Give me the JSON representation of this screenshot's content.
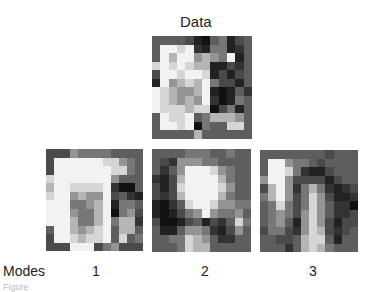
{
  "figure": {
    "title": "Data",
    "modes_label": "Modes",
    "mode_numbers": [
      "1",
      "2",
      "3"
    ],
    "caption": "Figure"
  },
  "palette_levels": [
    "#111111",
    "#222222",
    "#333333",
    "#4a4a4a",
    "#5e5e5e",
    "#777777",
    "#949494",
    "#b5b5b5",
    "#d6d6d6",
    "#f2f2f2"
  ],
  "panels": {
    "data": [
      [
        4,
        4,
        4,
        4,
        3,
        1,
        0,
        4,
        5,
        1,
        3,
        4
      ],
      [
        4,
        9,
        9,
        8,
        9,
        2,
        1,
        5,
        5,
        1,
        2,
        4
      ],
      [
        4,
        9,
        7,
        9,
        9,
        6,
        7,
        6,
        5,
        9,
        1,
        4
      ],
      [
        8,
        9,
        8,
        9,
        8,
        7,
        7,
        1,
        1,
        3,
        2,
        4
      ],
      [
        3,
        9,
        9,
        8,
        9,
        9,
        8,
        1,
        3,
        1,
        3,
        4
      ],
      [
        1,
        9,
        6,
        7,
        8,
        7,
        9,
        5,
        3,
        3,
        1,
        4
      ],
      [
        9,
        8,
        7,
        6,
        6,
        7,
        9,
        1,
        0,
        1,
        4,
        2
      ],
      [
        9,
        8,
        7,
        6,
        7,
        6,
        9,
        2,
        0,
        1,
        5,
        4
      ],
      [
        9,
        8,
        8,
        8,
        7,
        8,
        8,
        0,
        3,
        5,
        1,
        4
      ],
      [
        4,
        9,
        8,
        8,
        9,
        4,
        5,
        7,
        7,
        7,
        6,
        4
      ],
      [
        4,
        9,
        9,
        8,
        9,
        0,
        5,
        4,
        4,
        8,
        8,
        4
      ],
      [
        4,
        4,
        4,
        4,
        4,
        7,
        4,
        4,
        4,
        4,
        4,
        4
      ]
    ],
    "mode1": [
      [
        3,
        3,
        3,
        6,
        5,
        5,
        5,
        5,
        4,
        4,
        4,
        4
      ],
      [
        3,
        9,
        9,
        9,
        9,
        9,
        9,
        8,
        8,
        6,
        5,
        4
      ],
      [
        3,
        9,
        9,
        9,
        9,
        9,
        9,
        9,
        8,
        8,
        5,
        4
      ],
      [
        8,
        9,
        9,
        9,
        9,
        9,
        9,
        9,
        6,
        4,
        4,
        4
      ],
      [
        7,
        9,
        9,
        8,
        8,
        8,
        8,
        9,
        2,
        0,
        0,
        4
      ],
      [
        8,
        9,
        9,
        6,
        7,
        6,
        6,
        9,
        3,
        4,
        2,
        1
      ],
      [
        9,
        9,
        9,
        5,
        5,
        6,
        7,
        9,
        1,
        5,
        5,
        4
      ],
      [
        9,
        9,
        9,
        6,
        5,
        5,
        7,
        9,
        0,
        5,
        6,
        3
      ],
      [
        9,
        9,
        9,
        7,
        5,
        5,
        7,
        9,
        5,
        7,
        7,
        2
      ],
      [
        4,
        9,
        9,
        7,
        6,
        7,
        8,
        9,
        4,
        7,
        7,
        4
      ],
      [
        3,
        9,
        9,
        8,
        7,
        8,
        8,
        9,
        4,
        8,
        4,
        5
      ],
      [
        3,
        3,
        3,
        9,
        9,
        9,
        3,
        5,
        6,
        3,
        3,
        3
      ]
    ],
    "mode2": [
      [
        4,
        4,
        4,
        4,
        5,
        5,
        5,
        4,
        4,
        5,
        4,
        4
      ],
      [
        4,
        3,
        2,
        6,
        6,
        6,
        5,
        5,
        4,
        4,
        4,
        4
      ],
      [
        4,
        2,
        4,
        6,
        9,
        9,
        9,
        8,
        6,
        5,
        4,
        4
      ],
      [
        2,
        1,
        3,
        7,
        9,
        9,
        9,
        9,
        7,
        5,
        4,
        4
      ],
      [
        3,
        1,
        3,
        8,
        9,
        9,
        9,
        9,
        8,
        6,
        4,
        4
      ],
      [
        3,
        2,
        3,
        7,
        9,
        9,
        9,
        9,
        7,
        5,
        4,
        4
      ],
      [
        1,
        0,
        2,
        4,
        8,
        9,
        9,
        8,
        6,
        6,
        5,
        5
      ],
      [
        1,
        0,
        1,
        3,
        5,
        6,
        9,
        6,
        5,
        5,
        6,
        4
      ],
      [
        3,
        0,
        0,
        1,
        3,
        4,
        1,
        3,
        2,
        4,
        8,
        5
      ],
      [
        4,
        1,
        1,
        4,
        6,
        6,
        5,
        2,
        1,
        3,
        6,
        4
      ],
      [
        4,
        4,
        5,
        5,
        8,
        7,
        6,
        4,
        2,
        2,
        4,
        4
      ],
      [
        4,
        4,
        4,
        5,
        8,
        7,
        7,
        4,
        4,
        4,
        4,
        4
      ]
    ],
    "mode3": [
      [
        4,
        4,
        4,
        4,
        4,
        4,
        4,
        4,
        3,
        4,
        4,
        4
      ],
      [
        4,
        9,
        9,
        6,
        5,
        5,
        4,
        3,
        4,
        4,
        4,
        4
      ],
      [
        4,
        9,
        9,
        8,
        5,
        2,
        1,
        1,
        3,
        4,
        4,
        4
      ],
      [
        6,
        9,
        9,
        6,
        3,
        3,
        3,
        3,
        1,
        3,
        4,
        4
      ],
      [
        3,
        7,
        9,
        6,
        2,
        5,
        7,
        5,
        2,
        1,
        2,
        3
      ],
      [
        5,
        7,
        9,
        6,
        3,
        5,
        8,
        6,
        3,
        1,
        1,
        2
      ],
      [
        4,
        5,
        8,
        5,
        3,
        5,
        8,
        6,
        4,
        2,
        2,
        0
      ],
      [
        4,
        5,
        6,
        5,
        3,
        6,
        8,
        6,
        4,
        2,
        2,
        3
      ],
      [
        4,
        5,
        6,
        4,
        1,
        6,
        8,
        6,
        3,
        1,
        3,
        3
      ],
      [
        3,
        5,
        5,
        3,
        2,
        6,
        8,
        7,
        3,
        2,
        3,
        4
      ],
      [
        4,
        4,
        3,
        3,
        4,
        7,
        8,
        8,
        4,
        1,
        4,
        4
      ],
      [
        4,
        4,
        4,
        2,
        4,
        7,
        8,
        7,
        5,
        4,
        4,
        4
      ]
    ]
  }
}
